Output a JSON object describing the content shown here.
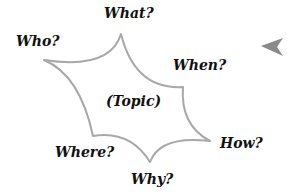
{
  "diagram": {
    "center": "(Topic)",
    "questions": {
      "who": "Who?",
      "what": "What?",
      "when": "When?",
      "how": "How?",
      "why": "Why?",
      "where": "Where?"
    },
    "colors": {
      "outline": "#a8a8a8",
      "arrow": "#8a8a8a",
      "text": "#111111"
    }
  }
}
